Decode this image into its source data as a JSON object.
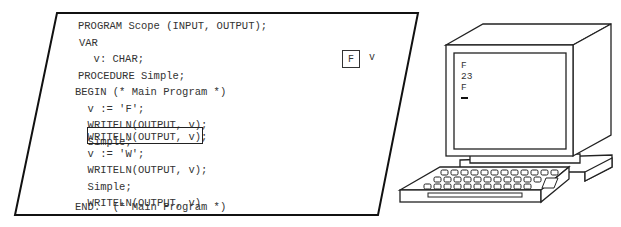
{
  "program_listing": {
    "lines": [
      "PROGRAM Scope (INPUT, OUTPUT);",
      "VAR",
      "  v: CHAR;",
      "PROCEDURE Simple;",
      "BEGIN (* Main Program *)",
      "  v := 'F';",
      "  WRITELN(OUTPUT, v);",
      "  Simple;",
      "  WRITELN(OUTPUT, v);",
      "  v := 'W';",
      "  WRITELN(OUTPUT, v);",
      "  Simple;",
      "  WRITELN(OUTPUT, v)",
      "END.  (* Main Program *)"
    ],
    "highlighted_line_index": 8
  },
  "memory": {
    "variable_name": "v",
    "variable_value": "F"
  },
  "terminal": {
    "output_lines": [
      "F",
      "23",
      "F"
    ],
    "cursor": "_"
  }
}
